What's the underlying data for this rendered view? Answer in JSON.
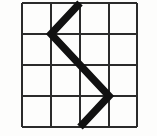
{
  "figure": {
    "kind": "grid-with-polyline",
    "canvas": {
      "width": 157,
      "height": 136
    },
    "background_color": "#fdfdfc",
    "grid": {
      "name": "square-grid",
      "rows": 4,
      "columns": 4,
      "line_color": "#2b2b2b",
      "line_width": 2.2,
      "outer_border_width": 2.6,
      "x_positions": [
        22,
        51,
        80,
        109,
        137
      ],
      "y_positions": [
        3,
        34,
        65,
        96,
        127
      ],
      "cell_width": 28.75,
      "cell_height": 31,
      "column_labels": [
        "1",
        "2",
        "3",
        "4"
      ],
      "row_labels": [
        "1",
        "2",
        "3",
        "4"
      ]
    },
    "polyline": {
      "name": "zigzag-path",
      "stroke_color": "#111111",
      "stroke_width": 7.5,
      "line_join": "miter",
      "line_cap": "butt",
      "vertex_count": 4,
      "points": [
        {
          "label": "start-top",
          "x": 80,
          "y": 3
        },
        {
          "label": "left-vertex",
          "x": 51,
          "y": 34
        },
        {
          "label": "right-vertex",
          "x": 109,
          "y": 96
        },
        {
          "label": "end-bottom",
          "x": 80,
          "y": 127
        }
      ],
      "segments": [
        {
          "name": "segment-1-down-left",
          "from": [
            80,
            3
          ],
          "to": [
            51,
            34
          ],
          "direction": "down-left",
          "spans_cells": 1
        },
        {
          "name": "segment-2-down-right",
          "from": [
            51,
            34
          ],
          "to": [
            109,
            96
          ],
          "direction": "down-right",
          "spans_cells": 2
        },
        {
          "name": "segment-3-down-left",
          "from": [
            109,
            96
          ],
          "to": [
            80,
            127
          ],
          "direction": "down-left",
          "spans_cells": 1
        }
      ]
    }
  }
}
